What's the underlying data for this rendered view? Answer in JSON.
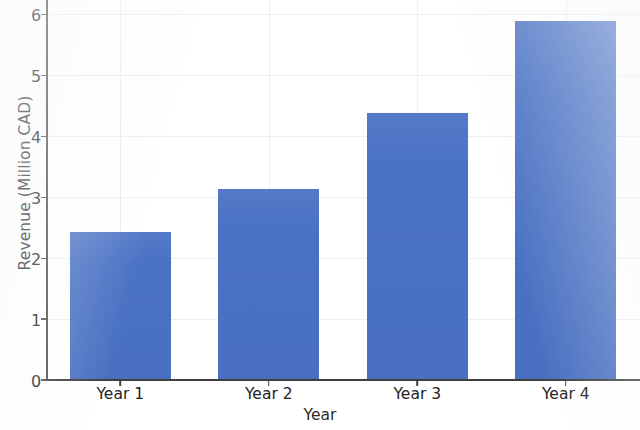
{
  "chart_data": {
    "type": "bar",
    "title": "",
    "xlabel": "Year",
    "ylabel": "Revenue (Million CAD)",
    "categories": [
      "Year 1",
      "Year 2",
      "Year 3",
      "Year 4"
    ],
    "values": [
      2.45,
      3.15,
      4.4,
      5.9
    ],
    "series": [
      {
        "name": "Revenue",
        "values": [
          2.45,
          3.15,
          4.4,
          5.9
        ],
        "color": "#4a72c4"
      }
    ],
    "ylim": [
      0,
      6.25
    ],
    "yticks": [
      0,
      1,
      2,
      3,
      4,
      5,
      6
    ],
    "ytick_labels": [
      "0",
      "1",
      "2",
      "3",
      "4",
      "5",
      "6"
    ],
    "grid": true,
    "grid_color": "#d0d4dc",
    "legend": false,
    "legend_position": "none",
    "bar_color": "#4a72c4",
    "background_color": "#ffffff",
    "axis_color": "#4d4d4d",
    "note": "Chart title is cropped off the top edge of the screenshot"
  }
}
